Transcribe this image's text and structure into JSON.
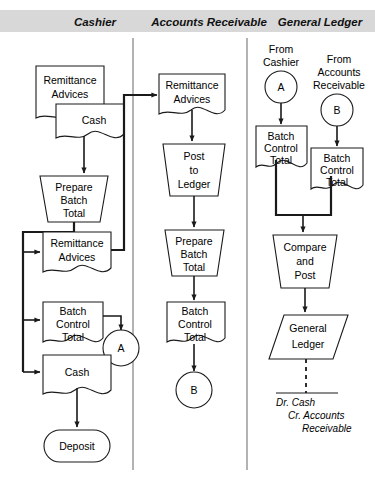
{
  "diagram": {
    "type": "flowchart",
    "header_band_color": "#d8d8d8",
    "columns": [
      {
        "id": "cashier",
        "label": "Cashier"
      },
      {
        "id": "accounts-receivable",
        "label": "Accounts Receivable"
      },
      {
        "id": "general-ledger",
        "label": "General Ledger"
      }
    ],
    "cashier": {
      "remittance_advices_1": "Remittance\nAdvices",
      "remittance_advices_1_l1": "Remittance",
      "remittance_advices_1_l2": "Advices",
      "cash_overlay": "Cash",
      "prepare_batch_total_l1": "Prepare",
      "prepare_batch_total_l2": "Batch",
      "prepare_batch_total_l3": "Total",
      "remittance_advices_2_l1": "Remittance",
      "remittance_advices_2_l2": "Advices",
      "batch_control_total_l1": "Batch",
      "batch_control_total_l2": "Control",
      "batch_control_total_l3": "Total",
      "connector_a": "A",
      "cash_doc": "Cash",
      "deposit": "Deposit"
    },
    "accounts_receivable": {
      "remittance_advices_l1": "Remittance",
      "remittance_advices_l2": "Advices",
      "post_to_ledger_l1": "Post",
      "post_to_ledger_l2": "to",
      "post_to_ledger_l3": "Ledger",
      "prepare_batch_total_l1": "Prepare",
      "prepare_batch_total_l2": "Batch",
      "prepare_batch_total_l3": "Total",
      "batch_control_total_l1": "Batch",
      "batch_control_total_l2": "Control",
      "batch_control_total_l3": "Total",
      "connector_b": "B"
    },
    "general_ledger": {
      "from_cashier_l1": "From",
      "from_cashier_l2": "Cashier",
      "connector_a": "A",
      "from_ar_l1": "From",
      "from_ar_l2": "Accounts",
      "from_ar_l3": "Receivable",
      "connector_b": "B",
      "batch_control_total_left_l1": "Batch",
      "batch_control_total_left_l2": "Control",
      "batch_control_total_left_l3": "Total",
      "batch_control_total_right_l1": "Batch",
      "batch_control_total_right_l2": "Control",
      "batch_control_total_right_l3": "Total",
      "compare_and_post_l1": "Compare",
      "compare_and_post_l2": "and",
      "compare_and_post_l3": "Post",
      "general_ledger_l1": "General",
      "general_ledger_l2": "Ledger",
      "journal_entry_l1": "Dr. Cash",
      "journal_entry_l2": "Cr. Accounts",
      "journal_entry_l3": "Receivable"
    }
  }
}
